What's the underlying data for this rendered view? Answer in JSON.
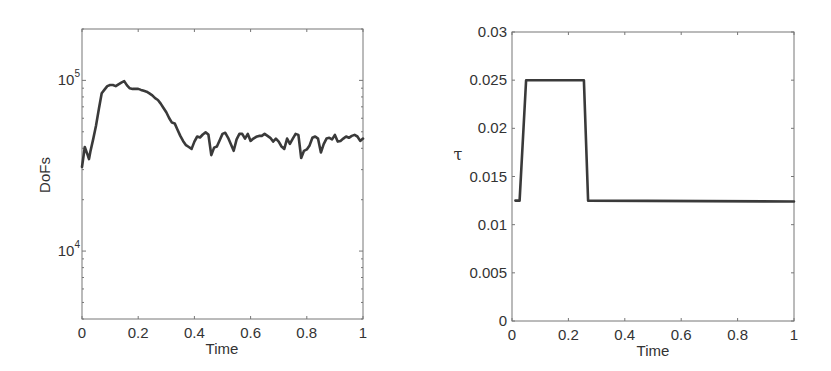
{
  "chart_data": [
    {
      "type": "line",
      "title": "",
      "xlabel": "Time",
      "ylabel": "DoFs",
      "yscale": "log",
      "xlim": [
        0,
        1
      ],
      "ylim": [
        4000,
        200000
      ],
      "grid": false,
      "legend": null,
      "x_ticks": [
        0,
        0.2,
        0.4,
        0.6,
        0.8,
        1
      ],
      "x_tick_labels": [
        "0",
        "0.2",
        "0.4",
        "0.6",
        "0.8",
        "1"
      ],
      "y_ticks": [
        10000,
        100000
      ],
      "y_tick_labels": [
        {
          "base": "10",
          "exp": "4"
        },
        {
          "base": "10",
          "exp": "5"
        }
      ],
      "series": [
        {
          "name": "DoFs",
          "color": "#3a3a3a",
          "x": [
            0,
            0.01,
            0.02,
            0.025,
            0.03,
            0.04,
            0.05,
            0.06,
            0.07,
            0.08,
            0.09,
            0.1,
            0.11,
            0.12,
            0.13,
            0.14,
            0.15,
            0.16,
            0.17,
            0.18,
            0.19,
            0.2,
            0.21,
            0.22,
            0.23,
            0.24,
            0.25,
            0.26,
            0.27,
            0.28,
            0.29,
            0.3,
            0.31,
            0.32,
            0.33,
            0.34,
            0.35,
            0.36,
            0.37,
            0.38,
            0.39,
            0.4,
            0.41,
            0.42,
            0.43,
            0.44,
            0.45,
            0.46,
            0.47,
            0.48,
            0.49,
            0.5,
            0.51,
            0.52,
            0.53,
            0.54,
            0.55,
            0.56,
            0.57,
            0.58,
            0.59,
            0.6,
            0.61,
            0.62,
            0.63,
            0.64,
            0.65,
            0.66,
            0.67,
            0.68,
            0.69,
            0.7,
            0.71,
            0.72,
            0.73,
            0.74,
            0.75,
            0.76,
            0.77,
            0.78,
            0.79,
            0.8,
            0.81,
            0.82,
            0.83,
            0.84,
            0.85,
            0.86,
            0.87,
            0.88,
            0.89,
            0.9,
            0.91,
            0.92,
            0.93,
            0.94,
            0.95,
            0.96,
            0.97,
            0.98,
            0.99,
            1.0
          ],
          "values": [
            31100,
            40700,
            36600,
            34600,
            38300,
            45300,
            54300,
            68200,
            84100,
            88300,
            92600,
            93900,
            93900,
            92600,
            94900,
            97100,
            99100,
            93400,
            89900,
            89200,
            89200,
            89200,
            88000,
            86900,
            85800,
            83900,
            81700,
            78600,
            76700,
            73100,
            68900,
            65000,
            60200,
            56600,
            56000,
            51400,
            47300,
            44000,
            41700,
            40700,
            39700,
            43800,
            46900,
            46300,
            48200,
            49600,
            48200,
            36500,
            40400,
            41000,
            44600,
            48600,
            49300,
            46100,
            42300,
            38700,
            45100,
            48600,
            48600,
            45600,
            48600,
            44200,
            45600,
            46700,
            47300,
            47300,
            48600,
            47300,
            46100,
            43800,
            45600,
            43800,
            41000,
            39700,
            45600,
            42500,
            45600,
            48600,
            47900,
            35100,
            38700,
            39400,
            41600,
            46100,
            46900,
            45600,
            37800,
            42300,
            45600,
            46100,
            45100,
            47900,
            43800,
            44200,
            45600,
            46900,
            46100,
            47300,
            47900,
            46900,
            44200,
            45600
          ]
        }
      ]
    },
    {
      "type": "line",
      "title": "",
      "xlabel": "Time",
      "ylabel": "τ",
      "yscale": "linear",
      "xlim": [
        0,
        1
      ],
      "ylim": [
        0,
        0.03
      ],
      "grid": false,
      "legend": null,
      "x_ticks": [
        0,
        0.2,
        0.4,
        0.6,
        0.8,
        1
      ],
      "x_tick_labels": [
        "0",
        "0.2",
        "0.4",
        "0.6",
        "0.8",
        "1"
      ],
      "y_ticks": [
        0,
        0.005,
        0.01,
        0.015,
        0.02,
        0.025,
        0.03
      ],
      "y_tick_labels": [
        "0",
        "0.005",
        "0.01",
        "0.015",
        "0.02",
        "0.025",
        "0.03"
      ],
      "series": [
        {
          "name": "tau",
          "color": "#3a3a3a",
          "x": [
            0.012,
            0.027,
            0.05,
            0.255,
            0.27,
            1.0
          ],
          "values": [
            0.0125,
            0.0125,
            0.025,
            0.025,
            0.0125,
            0.0124
          ]
        }
      ]
    }
  ]
}
